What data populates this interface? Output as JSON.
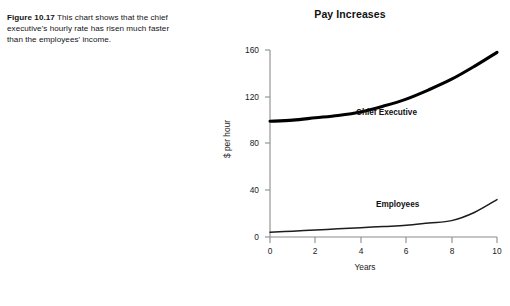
{
  "caption": {
    "figure_label": "Figure 10.17",
    "text": "This chart shows that the chief executive's hourly rate has risen much faster than the employees' income."
  },
  "chart_data": {
    "type": "line",
    "title": "Pay Increases",
    "xlabel": "Years",
    "ylabel": "$ per hour",
    "xlim": [
      0,
      10
    ],
    "ylim": [
      0,
      160
    ],
    "xticks": [
      "0",
      "2",
      "4",
      "6",
      "8",
      "10"
    ],
    "yticks": [
      "0",
      "40",
      "80",
      "120",
      "160"
    ],
    "grid": false,
    "legend_position": "inline-annotation",
    "x": [
      0,
      1,
      2,
      3,
      4,
      5,
      6,
      7,
      8,
      9,
      10
    ],
    "series": [
      {
        "name": "Chief Executive",
        "values": [
          99,
          100,
          102,
          104,
          107,
          112,
          118,
          126,
          135,
          146,
          158
        ]
      },
      {
        "name": "Employees",
        "values": [
          4,
          5,
          6,
          7,
          8,
          9,
          10,
          12,
          14,
          21,
          32
        ]
      }
    ],
    "annotations": [
      {
        "text": "Chief Executive",
        "series": "Chief Executive"
      },
      {
        "text": "Employees",
        "series": "Employees"
      }
    ],
    "colors": {
      "chief_executive_line": "#000000",
      "employees_line": "#1c1c1c",
      "axis": "#8c8c8c",
      "text": "#1a1a1a",
      "background": "#ffffff"
    }
  }
}
